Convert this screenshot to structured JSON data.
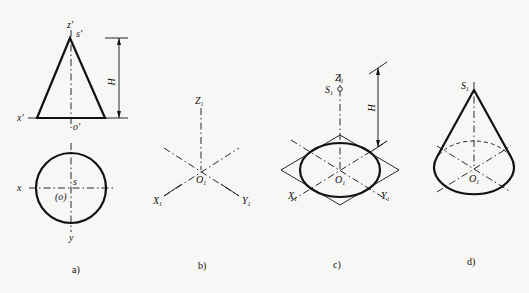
{
  "figure": {
    "panels": [
      {
        "id": "a",
        "caption": "a)",
        "labels": {
          "z_prime": "z'",
          "s_prime": "s'",
          "x_prime": "x'",
          "o_prime": "o'",
          "height": "H",
          "x": "x",
          "y": "y",
          "s": "s",
          "o": "(o)"
        },
        "description": "Orthographic projection of a cone: front view triangle with height H and top view circle"
      },
      {
        "id": "b",
        "caption": "b)",
        "labels": {
          "z1": "Z",
          "x1": "X",
          "y1": "Y",
          "o1": "O",
          "subscript": "1"
        },
        "description": "Isometric axes X1, Y1, Z1 with origin O1"
      },
      {
        "id": "c",
        "caption": "c)",
        "labels": {
          "z1": "Z",
          "s1": "S",
          "x1": "X",
          "y1": "Y",
          "o1": "O",
          "height": "H",
          "subscript": "1"
        },
        "description": "Isometric base ellipse inscribed in rhombus, apex S1 at height H"
      },
      {
        "id": "d",
        "caption": "d)",
        "labels": {
          "s1": "S",
          "o1": "O",
          "subscript": "1"
        },
        "description": "Completed isometric cone with tangent generatrices"
      }
    ],
    "colors": {
      "ink": "#111111",
      "paper": "#f7f7f5"
    }
  }
}
